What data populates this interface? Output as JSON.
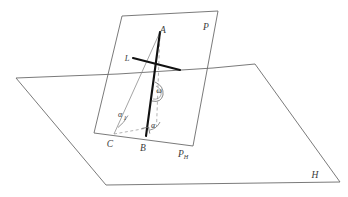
{
  "figure": {
    "kind": "geometry-diagram",
    "stroke_color": "#555555",
    "bold_color": "#111111",
    "dash_color": "#8a8a8a",
    "background": "#ffffff"
  },
  "labels": {
    "vertex_a": "A",
    "vertex_b": "B",
    "vertex_c": "C",
    "line_l": "L",
    "plane_p": "P",
    "plane_p_h_base": "P",
    "plane_p_h_sub": "H",
    "plane_h": "H",
    "angle_alpha": "α",
    "angle_alpha1_base": "α",
    "angle_alpha1_sub": "1",
    "angle_omega": "ω"
  },
  "geometry": {
    "horizontal_plane_points": "16,78 118,74 213,68 255,64 340,182 106,185",
    "vertical_plane_points": "122,16 218,11 193,146 94,133",
    "segment_ab": {
      "x1": 160,
      "y1": 32,
      "x2": 146,
      "y2": 136
    },
    "segment_l": {
      "x1": 133,
      "y1": 58,
      "x2": 180,
      "y2": 70
    },
    "dashed_a_to_c": {
      "x1": 160,
      "y1": 32,
      "x2": 114,
      "y2": 134
    },
    "dashed_a_vertical": {
      "x1": 160,
      "y1": 32,
      "x2": 156,
      "y2": 128
    },
    "dashed_c_to_foot": {
      "x1": 114,
      "y1": 134,
      "x2": 157,
      "y2": 126
    }
  }
}
